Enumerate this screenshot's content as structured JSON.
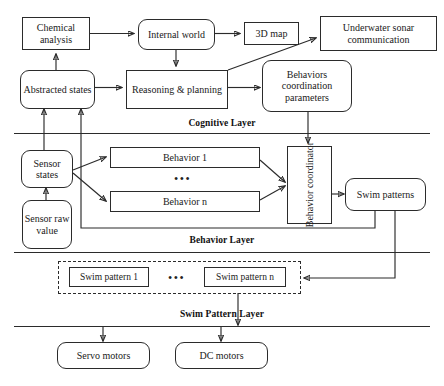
{
  "diagram": {
    "layers": [
      {
        "id": "cognitive",
        "label": "Cognitive Layer"
      },
      {
        "id": "behavior",
        "label": "Behavior Layer"
      },
      {
        "id": "swim_pattern",
        "label": "Swim Pattern Layer"
      }
    ],
    "nodes": {
      "chemical_analysis": "Chemical analysis",
      "internal_world": "Internal world",
      "three_d_map": "3D map",
      "underwater_sonar": "Underwater sonar communication",
      "abstracted_states": "Abstracted states",
      "reasoning_planning": "Reasoning & planning",
      "behaviors_coordination": "Behaviors coordination parameters",
      "sensor_states": "Sensor states",
      "sensor_raw_value": "Sensor raw value",
      "behavior_1": "Behavior 1",
      "behavior_n": "Behavior n",
      "behavior_coordinator": "Behavior coordinator",
      "swim_patterns": "Swim patterns",
      "swim_pattern_1": "Swim pattern 1",
      "swim_pattern_n": "Swim pattern n",
      "servo_motors": "Servo motors",
      "dc_motors": "DC motors"
    },
    "ellipses": {
      "behaviors": "•••",
      "swim_patterns": "•••"
    },
    "colors": {
      "stroke": "#2b2b2b",
      "background": "#ffffff",
      "text": "#1a1a1a"
    }
  }
}
